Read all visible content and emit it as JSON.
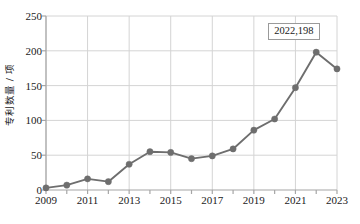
{
  "chart_data": {
    "type": "line",
    "title": "",
    "xlabel": "",
    "ylabel": "专利数量 / 项",
    "x": [
      2009,
      2010,
      2011,
      2012,
      2013,
      2014,
      2015,
      2016,
      2017,
      2018,
      2019,
      2020,
      2021,
      2022,
      2023
    ],
    "values": [
      3,
      7,
      16,
      12,
      37,
      55,
      54,
      45,
      49,
      59,
      86,
      102,
      147,
      198,
      174
    ],
    "series": [
      {
        "name": "专利数量",
        "values": [
          3,
          7,
          16,
          12,
          37,
          55,
          54,
          45,
          49,
          59,
          86,
          102,
          147,
          198,
          174
        ]
      }
    ],
    "xlim": [
      2009,
      2023
    ],
    "ylim": [
      0,
      250
    ],
    "y_ticks": [
      0,
      50,
      100,
      150,
      200,
      250
    ],
    "y_tick_labels": [
      "0",
      "50",
      "100",
      "150",
      "200",
      "250"
    ],
    "x_ticks": [
      2009,
      2010,
      2011,
      2012,
      2013,
      2014,
      2015,
      2016,
      2017,
      2018,
      2019,
      2020,
      2021,
      2022,
      2023
    ],
    "x_tick_labels": [
      "2009",
      "",
      "2011",
      "",
      "2013",
      "",
      "2015",
      "",
      "2017",
      "",
      "2019",
      "",
      "2021",
      "",
      "2023"
    ],
    "grid": true,
    "grid_x_values": [
      2009,
      2011,
      2013,
      2015,
      2017,
      2019,
      2021,
      2023
    ],
    "grid_y_values": [
      50,
      100,
      150,
      200,
      250
    ],
    "legend": false,
    "legend_position": "none",
    "annotations": [
      {
        "label": "2022,198",
        "x": 2022,
        "y": 198
      }
    ],
    "marker": "circle",
    "colors": {
      "line": "#6e6e6e",
      "marker": "#6e6e6e",
      "grid": "#d4d4d4",
      "axis": "#a6a6a6",
      "text": "#1a1a1a",
      "callout_border": "#9a9a9a",
      "background": "#ffffff"
    }
  }
}
